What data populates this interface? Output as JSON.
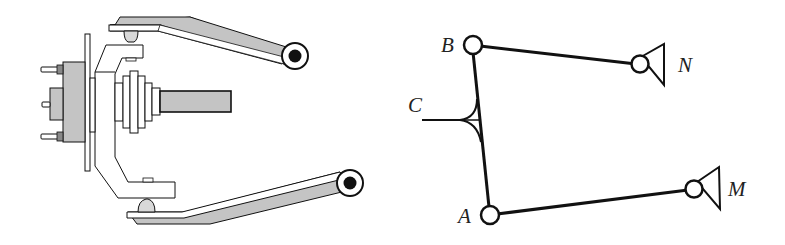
{
  "figures": {
    "left": {
      "description": "Double wishbone suspension illustration",
      "parts": [
        "wheel-hub",
        "wheel-studs",
        "brake-rotor",
        "steering-knuckle",
        "cv-joint",
        "drive-shaft",
        "upper-control-arm",
        "lower-control-arm",
        "upper-ball-joint",
        "lower-ball-joint",
        "upper-arm-bushing",
        "lower-arm-bushing"
      ]
    },
    "right": {
      "description": "Kinematic linkage schematic",
      "labels": {
        "A": "A",
        "B": "B",
        "C": "C",
        "M": "M",
        "N": "N"
      },
      "joints": [
        "A",
        "B"
      ],
      "ground_pivots": [
        "M",
        "N"
      ],
      "links": [
        "B-N",
        "A-M",
        "A-B"
      ],
      "attachment": "C"
    }
  },
  "colors": {
    "stroke": "#111111",
    "part_fill": "#c4c4c4",
    "background": "#ffffff"
  }
}
